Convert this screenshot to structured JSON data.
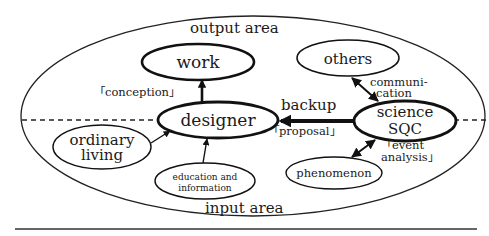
{
  "diagram": {
    "areas": {
      "output": "output area",
      "input": "input area"
    },
    "nodes": {
      "work": "work",
      "designer": "designer",
      "others": "others",
      "science_sqc": [
        "science",
        "SQC"
      ],
      "ordinary_living": [
        "ordinary",
        "living"
      ],
      "education": [
        "education and",
        "information"
      ],
      "phenomenon": "phenomenon"
    },
    "edge_labels": {
      "conception": "「conception」",
      "backup": "backup",
      "proposal": "「proposal」",
      "communication": [
        "communi-",
        "cation"
      ],
      "event_analysis": [
        "「event",
        "analysis」"
      ]
    },
    "edges": [
      {
        "from": "designer",
        "to": "work",
        "label": "conception"
      },
      {
        "from": "science_sqc",
        "to": "designer",
        "label": "backup / proposal"
      },
      {
        "from": "science_sqc",
        "to": "others",
        "label": "communication",
        "bidirectional": true
      },
      {
        "from": "science_sqc",
        "to": "phenomenon",
        "label": "event analysis",
        "bidirectional": true
      },
      {
        "from": "ordinary_living",
        "to": "designer"
      },
      {
        "from": "education",
        "to": "designer"
      }
    ]
  }
}
